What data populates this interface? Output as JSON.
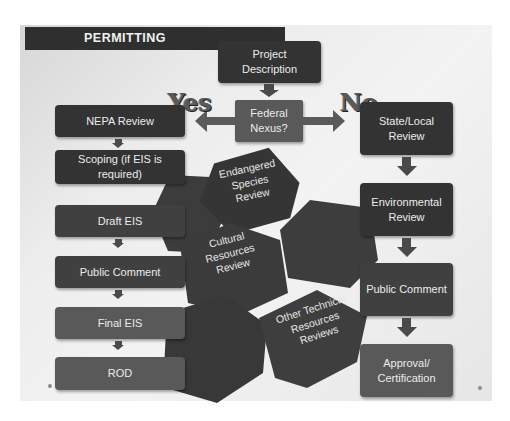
{
  "slide": {
    "title": "PERMITTING",
    "background_color": "#ebebeb",
    "box_color_dark": "#333333",
    "box_color_grey": "#595959"
  },
  "top": {
    "project_description": "Project Description",
    "federal_nexus": "Federal Nexus?",
    "yes_label": "Yes",
    "no_label": "No"
  },
  "federal_path": {
    "steps": [
      {
        "label": "NEPA Review"
      },
      {
        "label": "Scoping (if EIS is required)"
      },
      {
        "label": "Draft EIS"
      },
      {
        "label": "Public Comment"
      },
      {
        "label": "Final EIS"
      },
      {
        "label": "ROD"
      }
    ]
  },
  "state_path": {
    "steps": [
      {
        "label": "State/Local Review"
      },
      {
        "label": "Environmental Review"
      },
      {
        "label": "Public Comment"
      },
      {
        "label": "Approval/ Certification"
      }
    ]
  },
  "hexagons": [
    {
      "label": "Endangered Species Review"
    },
    {
      "label": "Cultural Resources Review"
    },
    {
      "label": "Other Technical Resources Reviews"
    },
    {
      "label": ""
    },
    {
      "label": ""
    }
  ]
}
